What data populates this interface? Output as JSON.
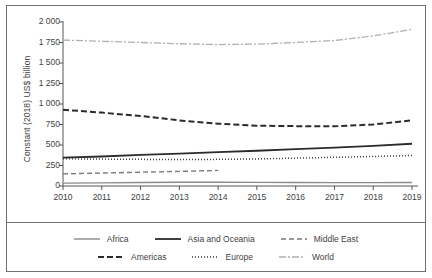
{
  "chart_data": {
    "type": "line",
    "title": "",
    "xlabel": "",
    "ylabel": "Constant (2018) US$ billion",
    "x": [
      2010,
      2011,
      2012,
      2013,
      2014,
      2015,
      2016,
      2017,
      2018,
      2019
    ],
    "xlim": [
      2010,
      2019
    ],
    "ylim": [
      0,
      2000
    ],
    "ytick_labels": [
      "2 000",
      "1 750",
      "1 500",
      "1 250",
      "1 000",
      "750",
      "500",
      "250",
      "0"
    ],
    "ytick_values": [
      2000,
      1750,
      1500,
      1250,
      1000,
      750,
      500,
      250,
      0
    ],
    "xtick_labels": [
      "2010",
      "2011",
      "2012",
      "2013",
      "2014",
      "2015",
      "2016",
      "2017",
      "2018",
      "2019"
    ],
    "grid": false,
    "legend_position": "bottom",
    "series": [
      {
        "name": "Africa",
        "style": "solid-thin",
        "color": "#8a8a8a",
        "x": [
          2010,
          2011,
          2012,
          2013,
          2014,
          2015,
          2016,
          2017,
          2018,
          2019
        ],
        "values": [
          35,
          38,
          42,
          45,
          46,
          44,
          42,
          41,
          41,
          42
        ]
      },
      {
        "name": "Asia and Oceania",
        "style": "solid-bold",
        "color": "#2b2b2b",
        "x": [
          2010,
          2011,
          2012,
          2013,
          2014,
          2015,
          2016,
          2017,
          2018,
          2019
        ],
        "values": [
          345,
          360,
          380,
          395,
          412,
          430,
          450,
          468,
          490,
          515
        ]
      },
      {
        "name": "Middle East",
        "style": "dashed",
        "color": "#7a7a7a",
        "x": [
          2010,
          2011,
          2012,
          2013,
          2014
        ],
        "values": [
          148,
          158,
          168,
          178,
          190
        ]
      },
      {
        "name": "Americas",
        "style": "dashed-bold",
        "color": "#2b2b2b",
        "x": [
          2010,
          2011,
          2012,
          2013,
          2014,
          2015,
          2016,
          2017,
          2018,
          2019
        ],
        "values": [
          930,
          895,
          855,
          800,
          760,
          735,
          730,
          728,
          750,
          800
        ]
      },
      {
        "name": "Europe",
        "style": "dotted",
        "color": "#3a3a3a",
        "x": [
          2010,
          2011,
          2012,
          2013,
          2014,
          2015,
          2016,
          2017,
          2018,
          2019
        ],
        "values": [
          332,
          328,
          325,
          322,
          325,
          330,
          340,
          350,
          360,
          372
        ]
      },
      {
        "name": "World",
        "style": "dash-dot",
        "color": "#b0b0b0",
        "x": [
          2010,
          2011,
          2012,
          2013,
          2014,
          2015,
          2016,
          2017,
          2018,
          2019
        ],
        "values": [
          1780,
          1765,
          1750,
          1735,
          1725,
          1730,
          1750,
          1775,
          1830,
          1910
        ]
      }
    ]
  },
  "axis": {
    "y_title": "Constant (2018) US$ billion"
  },
  "legend": {
    "rows": [
      [
        {
          "label": "Africa",
          "style": "solid-thin",
          "color": "#8a8a8a"
        },
        {
          "label": "Asia and Oceania",
          "style": "solid-bold",
          "color": "#2b2b2b"
        },
        {
          "label": "Middle East",
          "style": "dashed",
          "color": "#7a7a7a"
        }
      ],
      [
        {
          "label": "Americas",
          "style": "dashed-bold",
          "color": "#2b2b2b"
        },
        {
          "label": "Europe",
          "style": "dotted",
          "color": "#3a3a3a"
        },
        {
          "label": "World",
          "style": "dash-dot",
          "color": "#b0b0b0"
        }
      ]
    ]
  },
  "colors": {
    "frame": "#6e6e6e",
    "axis": "#555555",
    "text": "#3f3f3f",
    "background": "#ffffff"
  }
}
